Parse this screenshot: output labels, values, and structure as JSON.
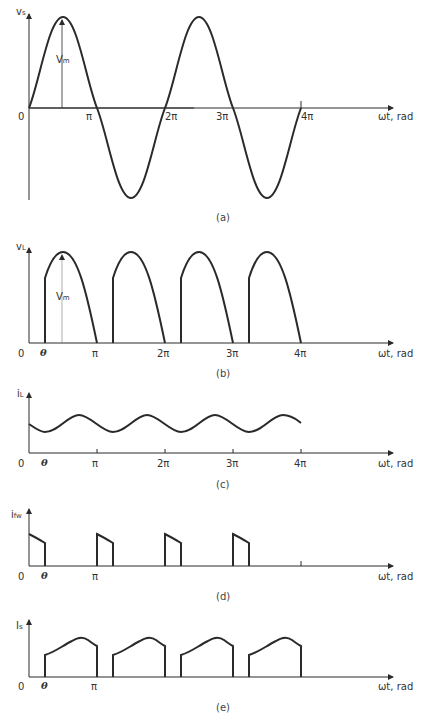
{
  "figure": {
    "x_axis_label": "ωt, rad",
    "origin_label": "0",
    "theta_label": "θ",
    "tick_labels": [
      "π",
      "2π",
      "3π",
      "4π"
    ],
    "colors": {
      "ink": "#2a2a2a",
      "background": "#ffffff"
    }
  },
  "panels": [
    {
      "id": "a",
      "caption": "(a)",
      "y_label_main": "v",
      "y_label_sub": "s",
      "annotation_main": "V",
      "annotation_sub": "m",
      "description": "Supply voltage v_s = Vm sin(ωt), full sinusoid from 0 to 4π"
    },
    {
      "id": "b",
      "caption": "(b)",
      "y_label_main": "v",
      "y_label_sub": "L",
      "annotation_main": "V",
      "annotation_sub": "m",
      "description": "Load voltage v_L: half-sine segments starting at firing angle θ in each half cycle"
    },
    {
      "id": "c",
      "caption": "(c)",
      "y_label_main": "i",
      "y_label_sub": "L",
      "description": "Load current i_L: continuous ripple current"
    },
    {
      "id": "d",
      "caption": "(d)",
      "y_label_main": "i",
      "y_label_sub": "fw",
      "description": "Freewheeling diode current i_fw: decaying pulses from nπ to nπ+θ"
    },
    {
      "id": "e",
      "caption": "(e)",
      "y_label_main": "I",
      "y_label_sub": "s",
      "description": "Supply current I_s: pulses from nπ+θ to (n+1)π"
    }
  ]
}
